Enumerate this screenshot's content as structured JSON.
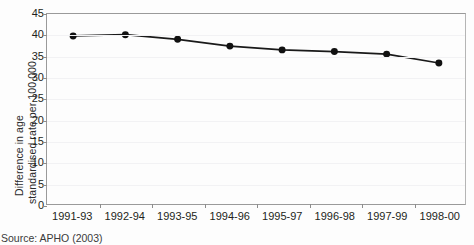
{
  "chart_data": {
    "type": "line",
    "title": "",
    "subtitle": "",
    "xlabel": "",
    "ylabel": "Difference in age standardised rate per 100,000",
    "ylabel_lines": [
      "Difference in age",
      "standardised rate per 100,000"
    ],
    "categories": [
      "1991-93",
      "1992-94",
      "1993-95",
      "1994-96",
      "1995-97",
      "1996-98",
      "1997-99",
      "1998-00"
    ],
    "values": [
      39.8,
      40.1,
      39.0,
      37.4,
      36.5,
      36.1,
      35.5,
      33.4
    ],
    "series": [
      {
        "name": "Difference in age standardised rate per 100,000",
        "values": [
          39.8,
          40.1,
          39.0,
          37.4,
          36.5,
          36.1,
          35.5,
          33.4
        ]
      }
    ],
    "ylim": [
      0,
      45
    ],
    "yticks": [
      0,
      5,
      10,
      15,
      20,
      25,
      30,
      35,
      40,
      45
    ],
    "ytick_labels": [
      "0",
      "5",
      "10",
      "15",
      "20",
      "25",
      "30",
      "35",
      "40",
      "45"
    ],
    "grid": true,
    "legend": false,
    "legend_position": "none",
    "marker": "circle",
    "line_color": "#1a1a1a",
    "marker_color": "#111111",
    "grid_color": "#f2f2f4",
    "axis_color": "#9a9a9a",
    "background_color": "#fdfdfd"
  },
  "caption": {
    "source": "Source: APHO (2003)"
  }
}
